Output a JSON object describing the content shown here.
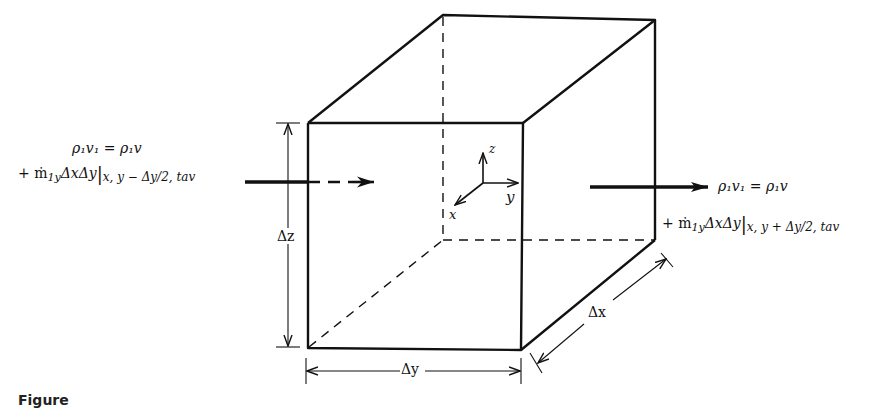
{
  "figure": {
    "type": "control-volume-diagram",
    "caption_visible_fragment": "Figure"
  },
  "inflow": {
    "line1": "ρ₁v₁ = ρ₁v",
    "line2_prefix": "+ ṁ",
    "line2_sub": "1y",
    "line2_mid": "ΔxΔy",
    "line2_eval": "x, y − Δy/2, tav"
  },
  "outflow": {
    "line1": "ρ₁v₁ = ρ₁v",
    "line2_prefix": "+ ṁ",
    "line2_sub": "1y",
    "line2_mid": "ΔxΔy",
    "line2_eval": "x, y + Δy/2, tav"
  },
  "axes": {
    "x": "x",
    "y": "y",
    "z": "z"
  },
  "dimensions": {
    "dz": "Δz",
    "dy": "Δy",
    "dx": "Δx"
  },
  "colors": {
    "ink": "#111111",
    "background": "#ffffff"
  }
}
